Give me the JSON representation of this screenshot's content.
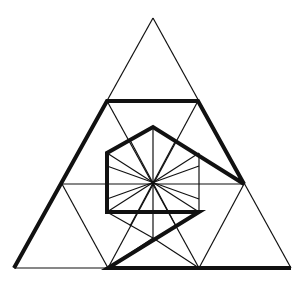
{
  "diagram": {
    "colors": {
      "background": "#ffffff",
      "stroke": "#111111"
    },
    "stroke_widths": {
      "thin": 1.2,
      "thick": 4
    },
    "thin_lines": [
      [
        153,
        18,
        14,
        268
      ],
      [
        153,
        18,
        291,
        268
      ],
      [
        14,
        268,
        291,
        268
      ],
      [
        107,
        101,
        198,
        101
      ],
      [
        62,
        184,
        244,
        184
      ],
      [
        107,
        101,
        199,
        268
      ],
      [
        198,
        101,
        108,
        268
      ],
      [
        62,
        184,
        108,
        268
      ],
      [
        244,
        184,
        199,
        268
      ],
      [
        153,
        127,
        153,
        238
      ],
      [
        107,
        153,
        199,
        212
      ],
      [
        199,
        153,
        107,
        212
      ],
      [
        130,
        140,
        176,
        226
      ],
      [
        176,
        140,
        130,
        226
      ],
      [
        107,
        166,
        199,
        199
      ],
      [
        199,
        166,
        107,
        199
      ],
      [
        199,
        153,
        199,
        212
      ],
      [
        153,
        238,
        108,
        268
      ],
      [
        153,
        238,
        199,
        268
      ],
      [
        107,
        212,
        153,
        238
      ]
    ],
    "thick_path": [
      [
        14,
        268
      ],
      [
        107,
        101
      ],
      [
        198,
        101
      ],
      [
        244,
        184
      ],
      [
        153,
        127
      ],
      [
        107,
        153
      ],
      [
        107,
        212
      ],
      [
        199,
        212
      ],
      [
        108,
        268
      ],
      [
        291,
        268
      ]
    ]
  }
}
